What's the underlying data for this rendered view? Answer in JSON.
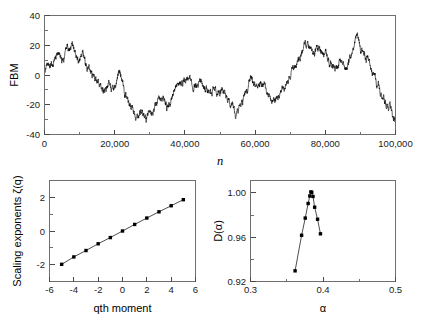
{
  "figure": {
    "background": "#ffffff",
    "ink": "#000000",
    "axis_color": "#4a4a4a"
  },
  "chart_data": [
    {
      "id": "fbm-trace",
      "type": "line",
      "title": "",
      "xlabel": "n",
      "ylabel": "FBM",
      "xlim": [
        0,
        100000
      ],
      "ylim": [
        -40,
        40
      ],
      "xticks": [
        0,
        20000,
        40000,
        60000,
        80000,
        100000
      ],
      "xticklabels": [
        "0",
        "20,000",
        "40,000",
        "60,000",
        "80,000",
        "100,000"
      ],
      "yticks": [
        -40,
        -20,
        0,
        20,
        40
      ],
      "yticklabels": [
        "-40",
        "-20",
        "0",
        "20",
        "40"
      ],
      "grid": false,
      "legend": "none",
      "series_color": "#000000",
      "description": "Fractional Brownian motion trajectory, 100,000 steps, Hurst-like roughness",
      "anchors_x": [
        0,
        2000,
        4000,
        5200,
        6500,
        8000,
        9500,
        11000,
        12500,
        14000,
        15500,
        17000,
        18500,
        20000,
        21500,
        23000,
        24500,
        26000,
        27500,
        29000,
        30500,
        32000,
        33500,
        35000,
        36500,
        38000,
        39500,
        41000,
        42500,
        44000,
        45500,
        47000,
        48500,
        50000,
        51500,
        53000,
        54500,
        56000,
        57500,
        59000,
        60500,
        62000,
        63500,
        65000,
        66500,
        68000,
        69500,
        71000,
        72500,
        74000,
        75500,
        77000,
        78500,
        80000,
        81500,
        83000,
        84500,
        86000,
        87500,
        89000,
        90500,
        92000,
        93500,
        95000,
        96500,
        98000,
        100000
      ],
      "anchors_y": [
        2,
        5,
        14,
        9,
        17,
        20,
        12,
        16,
        3,
        -2,
        -7,
        -12,
        -5,
        -9,
        2,
        -14,
        -20,
        -26,
        -24,
        -29,
        -27,
        -22,
        -17,
        -21,
        -13,
        -9,
        -6,
        -2,
        -8,
        -3,
        -9,
        -13,
        -12,
        -14,
        -12,
        -18,
        -27,
        -20,
        -12,
        -3,
        -8,
        -5,
        -13,
        -19,
        -16,
        -10,
        -4,
        4,
        12,
        19,
        21,
        17,
        20,
        16,
        6,
        2,
        8,
        3,
        12,
        26,
        14,
        10,
        3,
        -6,
        -14,
        -21,
        -30
      ]
    },
    {
      "id": "scaling-exponents",
      "type": "scatter",
      "title": "",
      "xlabel": "qth moment",
      "ylabel": "Scaling exponents ζ(q)",
      "xlim": [
        -6,
        6
      ],
      "ylim": [
        -3,
        3
      ],
      "xticks": [
        -6,
        -4,
        -2,
        0,
        2,
        4,
        6
      ],
      "xticklabels": [
        "-6",
        "-4",
        "-2",
        "0",
        "2",
        "4",
        "6"
      ],
      "yticks": [
        -2,
        0,
        2
      ],
      "yticklabels": [
        "-2",
        "0",
        "2"
      ],
      "grid": false,
      "legend": "none",
      "marker": "filled-square",
      "marker_color": "#000000",
      "line_color": "#222222",
      "x": [
        -5,
        -4,
        -3,
        -2,
        -1,
        0,
        1,
        2,
        3,
        4,
        5
      ],
      "y": [
        -1.98,
        -1.54,
        -1.16,
        -0.76,
        -0.39,
        0.0,
        0.39,
        0.77,
        1.14,
        1.5,
        1.86
      ]
    },
    {
      "id": "multifractal-spectrum",
      "type": "scatter",
      "title": "",
      "xlabel": "α",
      "ylabel": "D(α)",
      "xlim": [
        0.3,
        0.5
      ],
      "ylim": [
        0.92,
        1.01
      ],
      "xticks": [
        0.3,
        0.4,
        0.5
      ],
      "xticklabels": [
        "0.3",
        "0.4",
        "0.5"
      ],
      "yticks": [
        0.92,
        0.96,
        1.0
      ],
      "yticklabels": [
        "0.92",
        "0.96",
        "1.00"
      ],
      "grid": false,
      "legend": "none",
      "marker": "filled-square",
      "marker_color": "#000000",
      "line_color": "#222222",
      "x": [
        0.3615,
        0.3705,
        0.3755,
        0.3795,
        0.3818,
        0.3832,
        0.3845,
        0.3862,
        0.3885,
        0.3925,
        0.3965
      ],
      "y": [
        0.9295,
        0.9612,
        0.9765,
        0.9895,
        0.9962,
        0.9998,
        0.9995,
        0.9958,
        0.9862,
        0.9755,
        0.9625
      ]
    }
  ]
}
